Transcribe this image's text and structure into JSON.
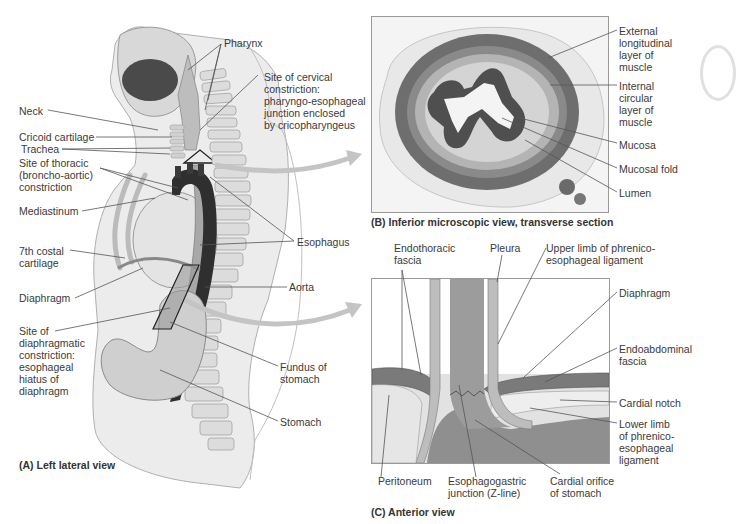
{
  "panel_a": {
    "caption": "(A) Left lateral view",
    "labels": {
      "pharynx": "Pharynx",
      "cervical": "Site of cervical\nconstriction:\npharyngo-esophageal\njunction enclosed\nby cricopharyngeus",
      "neck": "Neck",
      "cricoid": "Cricoid cartilage",
      "trachea": "Trachea",
      "thoracic": "Site of thoracic\n(broncho-aortic)\nconstriction",
      "mediastinum": "Mediastinum",
      "costal": "7th costal\ncartilage",
      "diaphragm": "Diaphragm",
      "diaphragmatic": "Site of\ndiaphragmatic\nconstriction:\nesophageal\nhiatus of\ndiaphragm",
      "esophagus": "Esophagus",
      "aorta": "Aorta",
      "fundus": "Fundus of\nstomach",
      "stomach": "Stomach"
    }
  },
  "panel_b": {
    "caption": "(B) Inferior microscopic view, transverse section",
    "labels": {
      "external": "External\nlongitudinal\nlayer of\nmuscle",
      "internal": "Internal\ncircular\nlayer of\nmuscle",
      "mucosa": "Mucosa",
      "mucosal_fold": "Mucosal fold",
      "lumen": "Lumen"
    }
  },
  "panel_c": {
    "caption": "(C) Anterior view",
    "labels": {
      "endothoracic": "Endothoracic\nfascia",
      "pleura": "Pleura",
      "upper_limb": "Upper limb of phrenico-\nesophageal ligament",
      "diaphragm": "Diaphragm",
      "endoabdominal": "Endoabdominal\nfascia",
      "cardial_notch": "Cardial notch",
      "lower_limb": "Lower limb\nof phrenico-\nesophageal\nligament",
      "peritoneum": "Peritoneum",
      "ej": "Esophagogastric\njunction (Z-line)",
      "cardial_orifice": "Cardial orifice\nof stomach"
    }
  },
  "colors": {
    "body": "#e6e6e6",
    "aorta": "#2e2e2e",
    "esophagus": "#9a9a9a",
    "bone": "#d9d9d9",
    "leader": "#555555",
    "arrow": "#bdbdbd"
  }
}
